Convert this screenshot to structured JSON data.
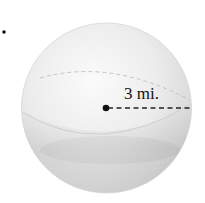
{
  "figure": {
    "type": "sphere",
    "radius_label": "3 mi.",
    "radius_value": 3,
    "radius_unit": "mi.",
    "colors": {
      "sphere_light": "#f7f7f7",
      "sphere_mid": "#e4e4e4",
      "sphere_dark": "#c9c9c9",
      "outline": "#d0d0d0",
      "line": "#222222",
      "equator_back": "#bdbdbd"
    }
  }
}
